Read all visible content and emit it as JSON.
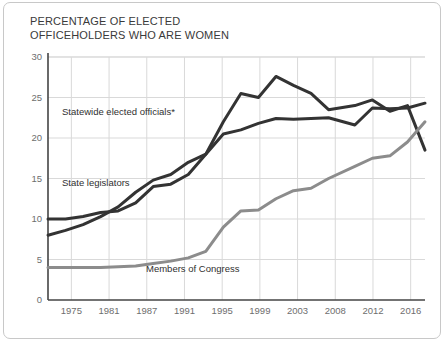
{
  "title": "PERCENTAGE OF ELECTED\nOFFICEHOLDERS WHO ARE WOMEN",
  "colors": {
    "dark_line": "#333333",
    "gray_line": "#8c8c8c",
    "grid": "#d9d9d9",
    "axis": "#444444",
    "tick_text": "#6e6e6e",
    "border": "#c8c8c8",
    "background": "#ffffff"
  },
  "labels": {
    "statewide": "Statewide elected officials*",
    "legislators": "State legislators",
    "congress": "Members of Congress"
  },
  "chart_data": {
    "type": "line",
    "title": "PERCENTAGE OF ELECTED OFFICEHOLDERS WHO ARE WOMEN",
    "xlabel": "",
    "ylabel": "",
    "ylim": [
      0,
      30
    ],
    "yticks": [
      0,
      5,
      10,
      15,
      20,
      25,
      30
    ],
    "xticks": [
      "1975",
      "1981",
      "1987",
      "1991",
      "1995",
      "1999",
      "2003",
      "2008",
      "2012",
      "2016"
    ],
    "grid": true,
    "legend": "inline-annotations",
    "x": [
      1973,
      1975,
      1977,
      1979,
      1981,
      1983,
      1985,
      1987,
      1989,
      1991,
      1993,
      1995,
      1997,
      1999,
      2001,
      2003,
      2005,
      2008,
      2010,
      2012,
      2014,
      2016
    ],
    "series": [
      {
        "name": "Statewide elected officials*",
        "color": "#333333",
        "values": [
          10.0,
          10.0,
          10.3,
          10.8,
          11.0,
          12.0,
          14.0,
          14.3,
          15.5,
          18.0,
          22.0,
          25.5,
          25.0,
          27.6,
          26.5,
          25.5,
          23.5,
          24.0,
          24.7,
          23.3,
          24.0,
          18.5
        ]
      },
      {
        "name": "State legislators",
        "color": "#333333",
        "values": [
          8.0,
          8.6,
          9.3,
          10.3,
          11.5,
          13.3,
          14.8,
          15.5,
          17.0,
          18.0,
          20.5,
          21.0,
          21.8,
          22.4,
          22.3,
          22.4,
          22.5,
          21.6,
          23.7,
          23.6,
          23.7,
          24.3
        ]
      },
      {
        "name": "Members of Congress",
        "color": "#8c8c8c",
        "values": [
          4.0,
          4.0,
          4.0,
          4.0,
          4.1,
          4.2,
          4.5,
          4.8,
          5.2,
          6.0,
          9.0,
          11.0,
          11.1,
          12.5,
          13.5,
          13.8,
          15.0,
          16.5,
          17.5,
          17.8,
          19.5,
          22.0
        ]
      }
    ]
  }
}
